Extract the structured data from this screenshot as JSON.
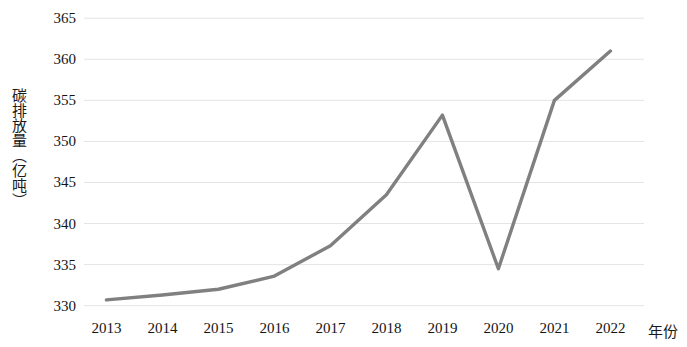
{
  "chart_data": {
    "type": "line",
    "title": "",
    "subtitle": "",
    "xlabel": "年份",
    "ylabel": "碳排放量（亿吨）",
    "categories": [
      "2013",
      "2014",
      "2015",
      "2016",
      "2017",
      "2018",
      "2019",
      "2020",
      "2021",
      "2022"
    ],
    "x": [
      2013,
      2014,
      2015,
      2016,
      2017,
      2018,
      2019,
      2020,
      2021,
      2022
    ],
    "values": [
      330.7,
      331.3,
      332.0,
      333.6,
      337.3,
      343.5,
      353.2,
      334.5,
      355.0,
      361.0
    ],
    "series": [
      {
        "name": "碳排放量",
        "values": [
          330.7,
          331.3,
          332.0,
          333.6,
          337.3,
          343.5,
          353.2,
          334.5,
          355.0,
          361.0
        ],
        "color": "#808080"
      }
    ],
    "ylim": [
      328.5,
      366.0
    ],
    "y_ticks": [
      330,
      335,
      340,
      345,
      350,
      355,
      360,
      365
    ],
    "y_tick_labels": [
      "330",
      "335",
      "340",
      "345",
      "350",
      "355",
      "360",
      "365"
    ],
    "xlim": [
      2012.6,
      2022.6
    ],
    "grid": {
      "horizontal": true,
      "vertical": false,
      "color": "#e4e4e4"
    },
    "legend": {
      "visible": false,
      "position": "none",
      "entries": []
    },
    "line_style": {
      "color": "#808080",
      "width": 3.4,
      "markers": false,
      "smoothing": "straight"
    },
    "annotations": [],
    "axes": {
      "x_axis_line": false,
      "y_axis_line": false,
      "tick_marks": false
    },
    "background": "#ffffff"
  }
}
